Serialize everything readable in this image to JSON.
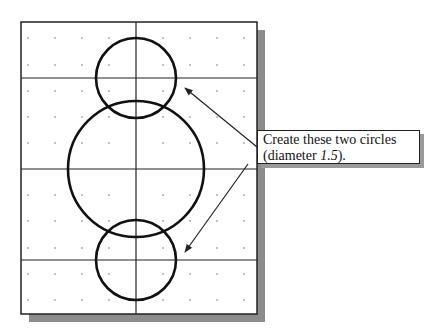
{
  "diagram": {
    "frame": {
      "x": 21,
      "y": 22,
      "width": 236,
      "height": 292,
      "shadow_color": "#8c8c8c",
      "shadow_offset": 8
    },
    "grid": {
      "vertical_lines_x": [
        136
      ],
      "horizontal_lines_y": [
        78,
        169,
        260
      ],
      "dot_columns_x": [
        28,
        55,
        82,
        109,
        163,
        190,
        217,
        244
      ],
      "dot_rows_y": [
        38,
        65,
        91,
        117,
        143,
        195,
        221,
        248,
        274,
        300
      ],
      "line_color": "#222222",
      "dot_color": "#777777"
    },
    "circles": [
      {
        "name": "top-circle",
        "cx": 136,
        "cy": 78,
        "r": 40,
        "label": "new circle (diameter 1.5)"
      },
      {
        "name": "center-circle",
        "cx": 136,
        "cy": 169,
        "r": 68,
        "label": "existing circle"
      },
      {
        "name": "bottom-circle",
        "cx": 136,
        "cy": 260,
        "r": 40,
        "label": "new circle (diameter 1.5)"
      }
    ],
    "arrows": [
      {
        "from": [
          257,
          147
        ],
        "to": [
          185,
          88
        ]
      },
      {
        "from": [
          248,
          164
        ],
        "to": [
          185,
          252
        ]
      }
    ],
    "callout": {
      "line1": "Create these two circles",
      "line2_prefix": "(diameter ",
      "line2_value": "1.5",
      "line2_suffix": ")."
    }
  }
}
